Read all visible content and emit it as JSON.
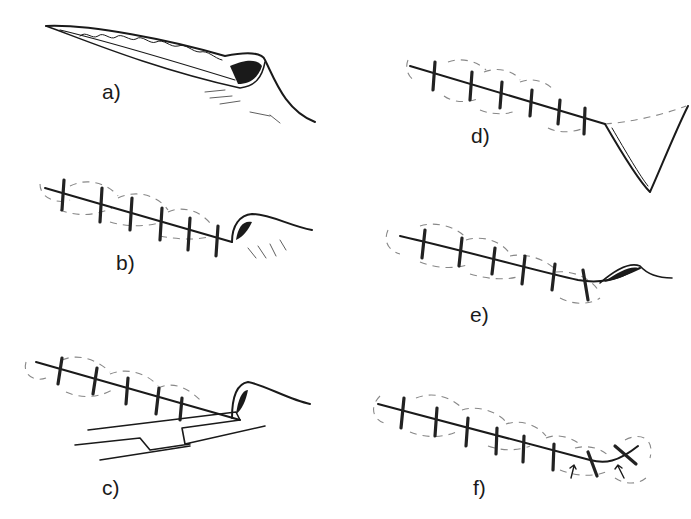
{
  "figure": {
    "panels": [
      {
        "id": "a",
        "label": "a)",
        "description": "Open incision wound with tissue visible"
      },
      {
        "id": "b",
        "label": "b)",
        "description": "Interrupted sutures placed with skin flap at end"
      },
      {
        "id": "c",
        "label": "c)",
        "description": "Sutures with forceps lifting skin flap"
      },
      {
        "id": "d",
        "label": "d)",
        "description": "Sutured incision with triangular excision at end"
      },
      {
        "id": "e",
        "label": "e)",
        "description": "Sutured incision with small remaining dog-ear"
      },
      {
        "id": "f",
        "label": "f)",
        "description": "Completed closure with arrows marking final sutures"
      }
    ]
  }
}
